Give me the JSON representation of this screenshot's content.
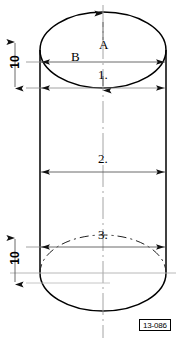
{
  "figure": {
    "code": "13-086",
    "type": "engineering-drawing",
    "width_px": 183,
    "height_px": 343,
    "colors": {
      "outline": "#000000",
      "dimension_line": "#555555",
      "center_line": "#888888",
      "hidden_line": "#333333",
      "background": "#ffffff"
    }
  },
  "geometry": {
    "cylinder": {
      "left_wall_x": 40,
      "right_wall_x": 166,
      "center_x": 103,
      "radius_x": 63,
      "ellipse_radius_y": 38,
      "top_ellipse_center_y": 50,
      "bottom_ellipse_center_y": 273,
      "top_arc_peak_y": 12,
      "bottom_arc_bottom_y": 311
    }
  },
  "labels": {
    "a": "A",
    "b": "B",
    "one": "1.",
    "two": "2.",
    "three": "3.",
    "ten_top": "10",
    "ten_bottom": "10"
  },
  "dimensions": [
    {
      "id": "A",
      "label": "A",
      "orientation": "vertical",
      "arrow": "up",
      "target": "top-ellipse-rear-arc",
      "label_x": 103,
      "label_y": 44
    },
    {
      "id": "B",
      "label": "B",
      "orientation": "horizontal",
      "arrows": "both",
      "line_y": 62,
      "from_x": 40,
      "to_x": 166,
      "label_x": 75,
      "label_y": 56
    },
    {
      "id": "1",
      "label": "1.",
      "orientation": "vertical",
      "arrow": "down",
      "target": "top-ellipse-front-arc",
      "line_y": 88,
      "label_x": 103,
      "label_y": 74
    },
    {
      "id": "2",
      "label": "2.",
      "orientation": "horizontal",
      "arrows": "both",
      "line_y": 172,
      "from_x": 40,
      "to_x": 166,
      "label_x": 103,
      "label_y": 158
    },
    {
      "id": "3",
      "label": "3.",
      "orientation": "horizontal",
      "arrows": "both",
      "line_y": 247,
      "from_x": 40,
      "to_x": 166,
      "label_x": 103,
      "label_y": 236
    },
    {
      "id": "ten-top",
      "label": "10",
      "orientation": "vertical",
      "arrows": "both",
      "line_x": 15,
      "from_y": 40,
      "to_y": 88,
      "label_x": 15,
      "label_y": 64
    },
    {
      "id": "ten-bottom",
      "label": "10",
      "orientation": "vertical",
      "arrows": "both",
      "line_x": 15,
      "from_y": 236,
      "to_y": 283,
      "label_x": 15,
      "label_y": 262
    }
  ]
}
